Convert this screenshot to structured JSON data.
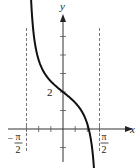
{
  "chart_data": {
    "type": "line",
    "title": "",
    "function": "y = 2 - tan(x)",
    "xlabel": "x",
    "ylabel": "y",
    "xlim": [
      -2.0,
      2.3
    ],
    "ylim": [
      -1.3,
      5.6
    ],
    "x_ticks": [
      -1.5708,
      -1.0472,
      -0.5236,
      0,
      0.5236,
      1.0472,
      1.5708
    ],
    "y_ticks": [
      -1,
      0,
      1,
      2,
      3,
      4,
      5
    ],
    "tick_labels": {
      "y_two": "2",
      "neg_half_pi_sign": "−",
      "pi": "π",
      "two": "2"
    },
    "asymptotes": [
      -1.5708,
      1.5708
    ],
    "series": [
      {
        "name": "y = 2 - tan x",
        "x_range": [
          -1.39,
          1.43
        ],
        "color": "#111111"
      }
    ],
    "annotations": [
      "y-intercept at 2"
    ],
    "grid": false
  }
}
